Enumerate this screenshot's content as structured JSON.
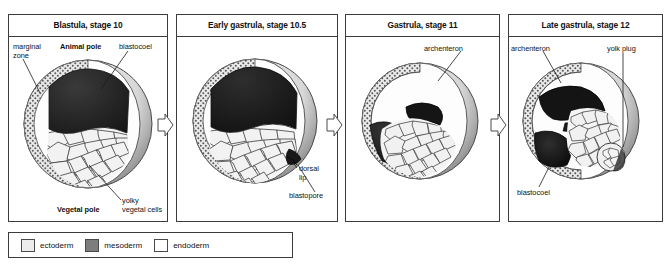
{
  "figure": {
    "panels": [
      {
        "id": "blastula",
        "title": "Blastula, stage 10",
        "labels": [
          {
            "name": "marginal-zone",
            "text": "marginal\nzone",
            "bold": false
          },
          {
            "name": "animal-pole",
            "text": "Animal pole",
            "bold": true
          },
          {
            "name": "blastocoel",
            "text": "blastocoel",
            "bold": false
          },
          {
            "name": "vegetal-pole",
            "text": "Vegetal pole",
            "bold": true
          },
          {
            "name": "yolky-vegetal-cells",
            "text": "yolky\nvegetal cells",
            "bold": false
          }
        ]
      },
      {
        "id": "early-gastrula",
        "title": "Early gastrula, stage 10.5",
        "labels": [
          {
            "name": "dorsal-lip",
            "text": "dorsal\nlip",
            "bold": false
          },
          {
            "name": "blastopore",
            "text": "blastopore",
            "bold": false
          }
        ]
      },
      {
        "id": "gastrula",
        "title": "Gastrula, stage 11",
        "labels": [
          {
            "name": "archenteron",
            "text": "archenteron",
            "bold": false
          }
        ]
      },
      {
        "id": "late-gastrula",
        "title": "Late gastrula, stage 12",
        "labels": [
          {
            "name": "archenteron",
            "text": "archenteron",
            "bold": false
          },
          {
            "name": "yolk-plug",
            "text": "yolk plug",
            "bold": false
          },
          {
            "name": "blastocoel",
            "text": "blastocoel",
            "bold": false
          }
        ]
      }
    ],
    "arrows": [
      {
        "name": "stage-arrow-1"
      },
      {
        "name": "stage-arrow-2"
      },
      {
        "name": "stage-arrow-3"
      }
    ],
    "legend": {
      "items": [
        {
          "name": "ectoderm",
          "label": "ectoderm",
          "color": "#ececec"
        },
        {
          "name": "mesoderm",
          "label": "mesoderm",
          "color": "#7d7d7d"
        },
        {
          "name": "endoderm",
          "label": "endoderm",
          "color": "#ffffff"
        }
      ]
    },
    "label_text": {
      "p1_marginal_1": "marginal",
      "p1_marginal_2": "zone",
      "p1_animal": "Animal pole",
      "p1_blastocoel": "blastocoel",
      "p1_vegetal": "Vegetal pole",
      "p1_yolky_1": "yolky",
      "p1_yolky_2": "vegetal cells",
      "p2_dorsal_1": "dorsal",
      "p2_dorsal_2": "lip",
      "p2_blastopore": "blastopore",
      "p3_archenteron": "archenteron",
      "p4_archenteron": "archenteron",
      "p4_yolkplug": "yolk plug",
      "p4_blastocoel": "blastocoel"
    }
  }
}
